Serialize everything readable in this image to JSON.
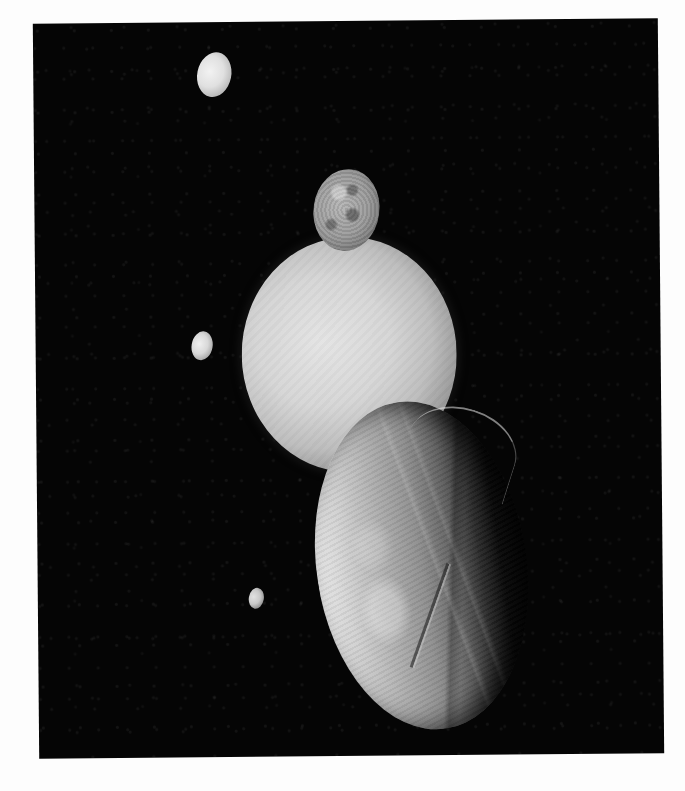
{
  "image": {
    "subject": "Uranus and its moons montage",
    "background_color": "#050505",
    "page_color": "#ffffff"
  },
  "bodies": [
    {
      "name": "moon-top",
      "kind": "moon",
      "shape": "small bright gibbous moon",
      "color": "#e6e6e6"
    },
    {
      "name": "moon-miranda",
      "kind": "moon",
      "shape": "cratered grey moon above planet",
      "color": "#9a9a9a"
    },
    {
      "name": "planet-uranus",
      "kind": "planet",
      "shape": "large pale smooth sphere",
      "color": "#d6d6d6"
    },
    {
      "name": "moon-mid",
      "kind": "moon",
      "shape": "small bright moon left of planet",
      "color": "#dcdcdc"
    },
    {
      "name": "moon-small",
      "kind": "moon",
      "shape": "tiny dim moon lower left",
      "color": "#c8c8c8"
    },
    {
      "name": "moon-ariel",
      "kind": "moon",
      "shape": "large cratered foreground moon with canyons",
      "color": "#b3b3b3"
    }
  ]
}
